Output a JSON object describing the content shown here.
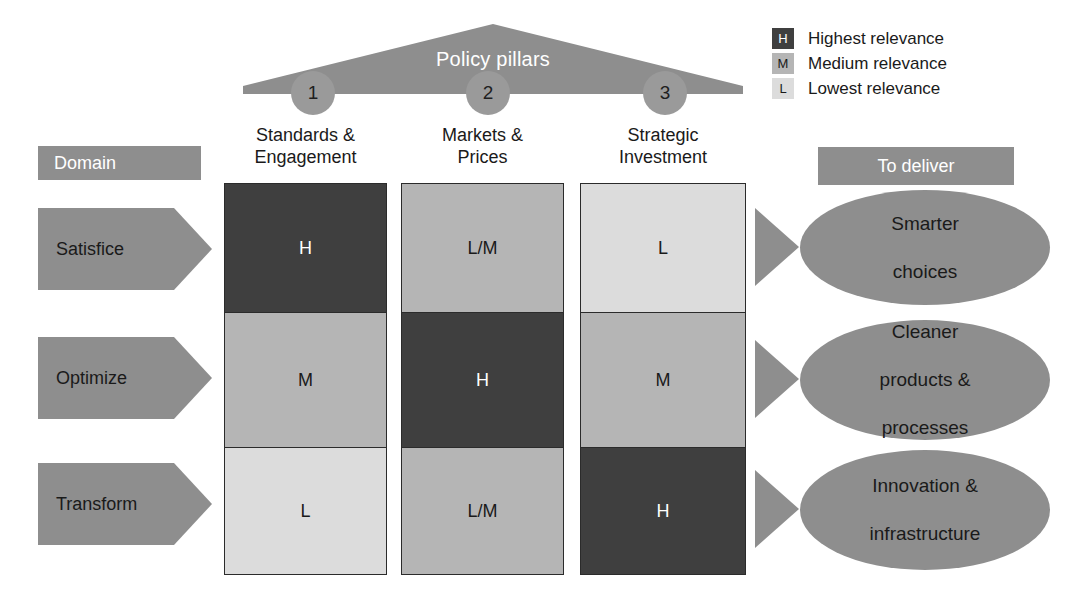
{
  "colors": {
    "high": "#3f3f3f",
    "medium": "#b5b5b5",
    "low": "#dcdcdc",
    "accent_gray": "#8e8e8e",
    "circle_gray": "#9a9a9a",
    "border": "#2b2b2b",
    "text_dark": "#1a1a1a",
    "text_light": "#ffffff",
    "background": "#ffffff"
  },
  "pillars": {
    "title": "Policy pillars",
    "markers": [
      "1",
      "2",
      "3"
    ]
  },
  "legend": {
    "items": [
      {
        "key": "H",
        "label": "Highest relevance",
        "level": "high"
      },
      {
        "key": "M",
        "label": "Medium relevance",
        "level": "medium"
      },
      {
        "key": "L",
        "label": "Lowest relevance",
        "level": "low"
      }
    ]
  },
  "left_header": {
    "label": "Domain"
  },
  "right_header": {
    "label": "To deliver"
  },
  "domains": [
    {
      "label": "Satisfice"
    },
    {
      "label": "Optimize"
    },
    {
      "label": "Transform"
    }
  ],
  "columns": [
    {
      "line1": "Standards &",
      "line2": "Engagement"
    },
    {
      "line1": "Markets &",
      "line2": "Prices"
    },
    {
      "line1": "Strategic",
      "line2": "Investment"
    }
  ],
  "matrix": {
    "rows": [
      {
        "domain": "Satisfice",
        "cells": [
          {
            "value": "H",
            "level": "high"
          },
          {
            "value": "L/M",
            "level": "medium"
          },
          {
            "value": "L",
            "level": "low"
          }
        ]
      },
      {
        "domain": "Optimize",
        "cells": [
          {
            "value": "M",
            "level": "medium"
          },
          {
            "value": "H",
            "level": "high"
          },
          {
            "value": "M",
            "level": "medium"
          }
        ]
      },
      {
        "domain": "Transform",
        "cells": [
          {
            "value": "L",
            "level": "low"
          },
          {
            "value": "L/M",
            "level": "medium"
          },
          {
            "value": "H",
            "level": "high"
          }
        ]
      }
    ]
  },
  "outcomes": [
    {
      "line1": "Smarter",
      "line2": "choices",
      "line3": ""
    },
    {
      "line1": "Cleaner",
      "line2": "products &",
      "line3": "processes"
    },
    {
      "line1": "Innovation &",
      "line2": "infrastructure",
      "line3": ""
    }
  ]
}
